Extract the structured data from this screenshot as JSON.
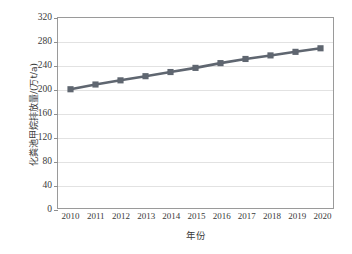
{
  "chart_data": {
    "type": "line",
    "title": "",
    "xlabel": "年份",
    "ylabel": "化粪池甲烷排放量/(万t/a)",
    "categories": [
      "2010",
      "2011",
      "2012",
      "2013",
      "2014",
      "2015",
      "2016",
      "2017",
      "2018",
      "2019",
      "2020"
    ],
    "x": [
      2010,
      2011,
      2012,
      2013,
      2014,
      2015,
      2016,
      2017,
      2018,
      2019,
      2020
    ],
    "series": [
      {
        "name": "化粪池甲烷排放量",
        "values": [
          200,
          208,
          215,
          222,
          229,
          236,
          244,
          251,
          257,
          263,
          269
        ]
      }
    ],
    "ylim": [
      0,
      320
    ],
    "yticks": [
      0,
      40,
      80,
      120,
      160,
      200,
      240,
      280,
      320
    ],
    "ytick_labels": [
      "0",
      "40",
      "80",
      "120",
      "160",
      "200",
      "240",
      "280",
      "320"
    ],
    "grid": true,
    "legend": "none",
    "marker": "square",
    "series_color": "#5f6670",
    "grid_color": "#e2e2e2",
    "axis_color": "#9a9a9a"
  }
}
